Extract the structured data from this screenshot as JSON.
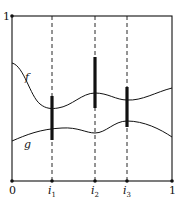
{
  "diagram": {
    "y_axis_label_top": "1",
    "x_axis_labels": {
      "origin": "0",
      "i1": "i",
      "i1_sub": "1",
      "i2": "i",
      "i2_sub": "2",
      "i3": "i",
      "i3_sub": "3",
      "end": "1"
    },
    "curves": {
      "f": {
        "label": "f"
      },
      "g": {
        "label": "g"
      }
    },
    "markers": [
      "i1",
      "i2",
      "i3"
    ],
    "colors": {
      "line": "#111111",
      "background": "#ffffff"
    }
  }
}
